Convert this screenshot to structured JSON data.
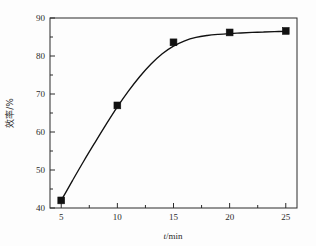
{
  "chart_data": {
    "type": "scatter",
    "title": "",
    "subtitle": "",
    "xlabel": "t/min",
    "xlabel_italic_part": "t",
    "xlabel_rest": "/min",
    "ylabel": "效率/%",
    "xlim": [
      4.0,
      26.0
    ],
    "ylim": [
      40,
      90
    ],
    "xticks": [
      5,
      10,
      15,
      20,
      25
    ],
    "xtick_labels": [
      "5",
      "10",
      "15",
      "20",
      "25"
    ],
    "yticks": [
      40,
      50,
      60,
      70,
      80,
      90
    ],
    "ytick_labels": [
      "40",
      "50",
      "60",
      "70",
      "80",
      "90"
    ],
    "x_minor_ticks": [
      7.5,
      12.5,
      17.5,
      22.5
    ],
    "y_minor_ticks": [
      45,
      55,
      65,
      75,
      85
    ],
    "grid": false,
    "legend": null,
    "legend_position": "none",
    "marker_style": "filled-square",
    "marker_color": "#111111",
    "line_color": "#111111",
    "frame": "box",
    "series": [
      {
        "name": "效率",
        "x": [
          5,
          10,
          15,
          20,
          25
        ],
        "values": [
          42.0,
          67.0,
          83.6,
          86.2,
          86.6
        ]
      }
    ],
    "fit_curve": {
      "description": "smooth saturating trend line through the data",
      "x": [
        5,
        6,
        7,
        8,
        9,
        10,
        11,
        12,
        13,
        14,
        15,
        16,
        17,
        18,
        19,
        20,
        21,
        22,
        23,
        24,
        25
      ],
      "y": [
        42.0,
        47.2,
        52.3,
        57.2,
        62.0,
        66.6,
        70.8,
        74.6,
        77.9,
        80.6,
        82.6,
        84.0,
        84.9,
        85.4,
        85.7,
        85.9,
        86.05,
        86.2,
        86.3,
        86.4,
        86.5
      ]
    }
  },
  "axis_labels": {
    "x_title_italic": "t",
    "x_title_rest": "/min",
    "y_title": "效率/%"
  },
  "colors": {
    "background": "#fdfdfd",
    "axis": "#2b2b2b",
    "marker": "#111111",
    "curve": "#111111"
  }
}
